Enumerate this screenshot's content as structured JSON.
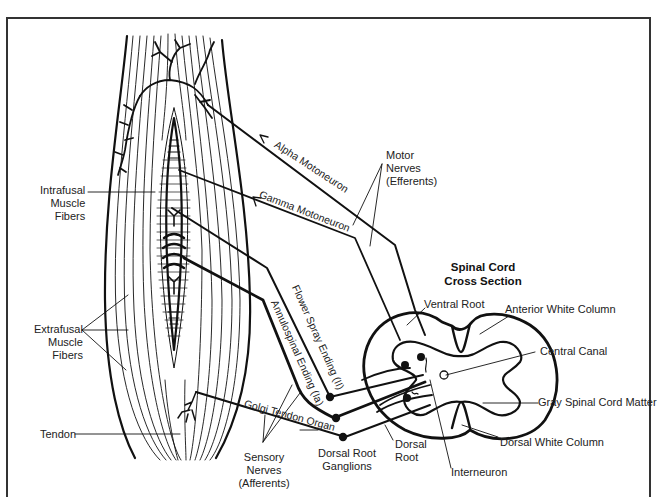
{
  "diagram": {
    "title": "Spinal Cord Cross Section",
    "title_lines": [
      "Spinal Cord",
      "Cross Section"
    ],
    "colors": {
      "ink": "#111111",
      "background": "#ffffff",
      "label": "#222222"
    },
    "labels": {
      "intrafusal": [
        "Intrafusal",
        "Muscle",
        "Fibers"
      ],
      "extrafusal": [
        "Extrafusal",
        "Muscle",
        "Fibers"
      ],
      "tendon": "Tendon",
      "alpha_motoneuron": "Alpha Motoneuron",
      "gamma_motoneuron": "Gamma Motoneuron",
      "motor_nerves": [
        "Motor",
        "Nerves",
        "(Efferents)"
      ],
      "flower_spray": "Flower Spray Ending (II)",
      "annulospiral": "Annulospinal Ending (Ia)",
      "golgi_tendon_organ": "Golgi Tendon Organ",
      "sensory_nerves": [
        "Sensory",
        "Nerves",
        "(Afferents)"
      ],
      "dorsal_root_ganglions": [
        "Dorsal Root",
        "Ganglions"
      ],
      "dorsal_root": [
        "Dorsal",
        "Root"
      ],
      "interneuron": "Interneuron",
      "ventral_root": "Ventral Root",
      "anterior_white_column": "Anterior White Column",
      "central_canal": "Central Canal",
      "gray_matter": "Gray Spinal Cord Matter",
      "dorsal_white_column": "Dorsal White Column"
    }
  }
}
